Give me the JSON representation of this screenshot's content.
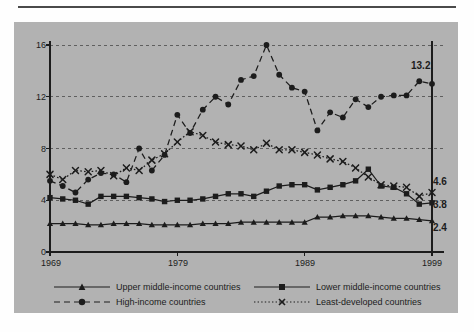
{
  "chart_data": {
    "type": "line",
    "title": "",
    "subtitle": "",
    "xlabel": "",
    "ylabel": "",
    "xlim": [
      1969,
      1999
    ],
    "ylim": [
      0,
      16
    ],
    "yticks": [
      0,
      4,
      8,
      12,
      16
    ],
    "xticks": [
      1969,
      1979,
      1989,
      1999
    ],
    "grid": "horizontal-dashed",
    "legend_position": "bottom",
    "x": [
      1969,
      1970,
      1971,
      1972,
      1973,
      1974,
      1975,
      1976,
      1977,
      1978,
      1979,
      1980,
      1981,
      1982,
      1983,
      1984,
      1985,
      1986,
      1987,
      1988,
      1989,
      1990,
      1991,
      1992,
      1993,
      1994,
      1995,
      1996,
      1997,
      1998,
      1999
    ],
    "series": [
      {
        "name": "High-income countries",
        "line": "dashed",
        "marker": "circle",
        "end_value_label": "13.2",
        "values": [
          5.5,
          5.1,
          4.6,
          5.6,
          6.1,
          6.0,
          5.4,
          8.0,
          6.3,
          7.5,
          10.6,
          9.2,
          11.0,
          12.0,
          11.4,
          13.3,
          13.6,
          16.0,
          13.7,
          12.7,
          12.4,
          9.4,
          10.8,
          10.4,
          11.8,
          11.2,
          12.0,
          12.1,
          12.1,
          13.2,
          13.0
        ]
      },
      {
        "name": "Least-developed countries",
        "line": "dotted",
        "marker": "x",
        "end_value_label": "4.6",
        "values": [
          6.0,
          5.6,
          6.3,
          6.2,
          6.3,
          5.9,
          6.5,
          6.3,
          7.1,
          7.6,
          8.5,
          9.3,
          9.0,
          8.5,
          8.3,
          8.2,
          7.9,
          8.4,
          7.9,
          7.9,
          7.7,
          7.5,
          7.2,
          7.0,
          6.5,
          5.8,
          5.2,
          5.1,
          5.0,
          4.3,
          4.6
        ]
      },
      {
        "name": "Lower middle-income countries",
        "line": "solid",
        "marker": "square",
        "end_value_label": "3.8",
        "values": [
          4.2,
          4.1,
          4.0,
          3.7,
          4.3,
          4.3,
          4.3,
          4.2,
          4.1,
          3.9,
          4.0,
          4.0,
          4.1,
          4.3,
          4.5,
          4.5,
          4.3,
          4.7,
          5.1,
          5.2,
          5.2,
          4.8,
          5.0,
          5.2,
          5.5,
          6.4,
          5.1,
          5.0,
          4.5,
          3.7,
          3.8
        ]
      },
      {
        "name": "Upper middle-income countries",
        "line": "solid",
        "marker": "triangle",
        "end_value_label": "2.4",
        "values": [
          2.2,
          2.2,
          2.2,
          2.1,
          2.1,
          2.2,
          2.2,
          2.2,
          2.1,
          2.1,
          2.1,
          2.1,
          2.2,
          2.2,
          2.2,
          2.3,
          2.3,
          2.3,
          2.3,
          2.3,
          2.3,
          2.7,
          2.7,
          2.8,
          2.8,
          2.8,
          2.7,
          2.6,
          2.6,
          2.5,
          2.4
        ]
      }
    ]
  },
  "axis": {
    "y_tick_labels": [
      "0",
      "4",
      "8",
      "12",
      "16"
    ],
    "x_tick_labels": [
      "1969",
      "1979",
      "1989",
      "1999"
    ]
  },
  "end_labels": {
    "high_income": "13.2",
    "least_developed": "4.6",
    "lower_middle": "3.8",
    "upper_middle": "2.4"
  },
  "legend": {
    "items": [
      {
        "label": "Upper middle-income countries",
        "style": "solid-triangle"
      },
      {
        "label": "Lower middle-income countries",
        "style": "solid-square"
      },
      {
        "label": "High-income countries",
        "style": "dashed-circle"
      },
      {
        "label": "Least-developed countries",
        "style": "dotted-x"
      }
    ]
  },
  "colors": {
    "panel": "#b2b2b2",
    "ink": "#1c1c1c",
    "grid": "#555555",
    "page": "#fefefe"
  }
}
